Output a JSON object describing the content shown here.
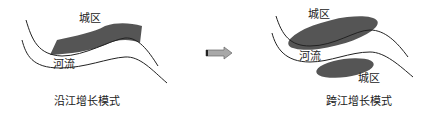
{
  "panels": {
    "left": {
      "city_label": "城区",
      "river_label": "河流",
      "caption": "沿江增长模式"
    },
    "right": {
      "city_label_top": "城区",
      "river_label": "河流",
      "city_label_bottom": "城区",
      "caption": "跨江增长模式"
    }
  },
  "arrow": {
    "icon": "right-arrow-icon"
  },
  "colors": {
    "city_fill": "#555555",
    "river_line": "#222222",
    "arrow_fill": "#a8a8a8"
  }
}
